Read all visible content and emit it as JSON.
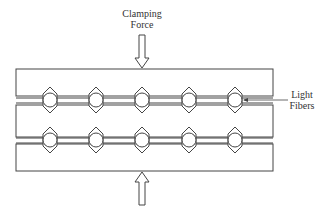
{
  "diagram": {
    "labels": {
      "clamping_force": [
        "Clamping",
        "Force"
      ],
      "light_fibers": [
        "Light",
        "Fibers"
      ]
    },
    "plates": [
      {
        "x": 16,
        "y": 69,
        "w": 257,
        "h": 27
      },
      {
        "x": 16,
        "y": 105,
        "w": 257,
        "h": 33
      },
      {
        "x": 16,
        "y": 144,
        "w": 257,
        "h": 27
      }
    ],
    "fiber_rows": [
      {
        "y": 100,
        "x": [
          50,
          96,
          142,
          189,
          235
        ]
      },
      {
        "y": 140,
        "x": [
          50,
          96,
          142,
          189,
          235
        ]
      }
    ],
    "arrows": [
      {
        "name": "top-clamping-arrow",
        "x": 142,
        "direction": "down"
      },
      {
        "name": "bottom-clamping-arrow",
        "x": 142,
        "direction": "up"
      }
    ],
    "line_color": "#444444"
  }
}
